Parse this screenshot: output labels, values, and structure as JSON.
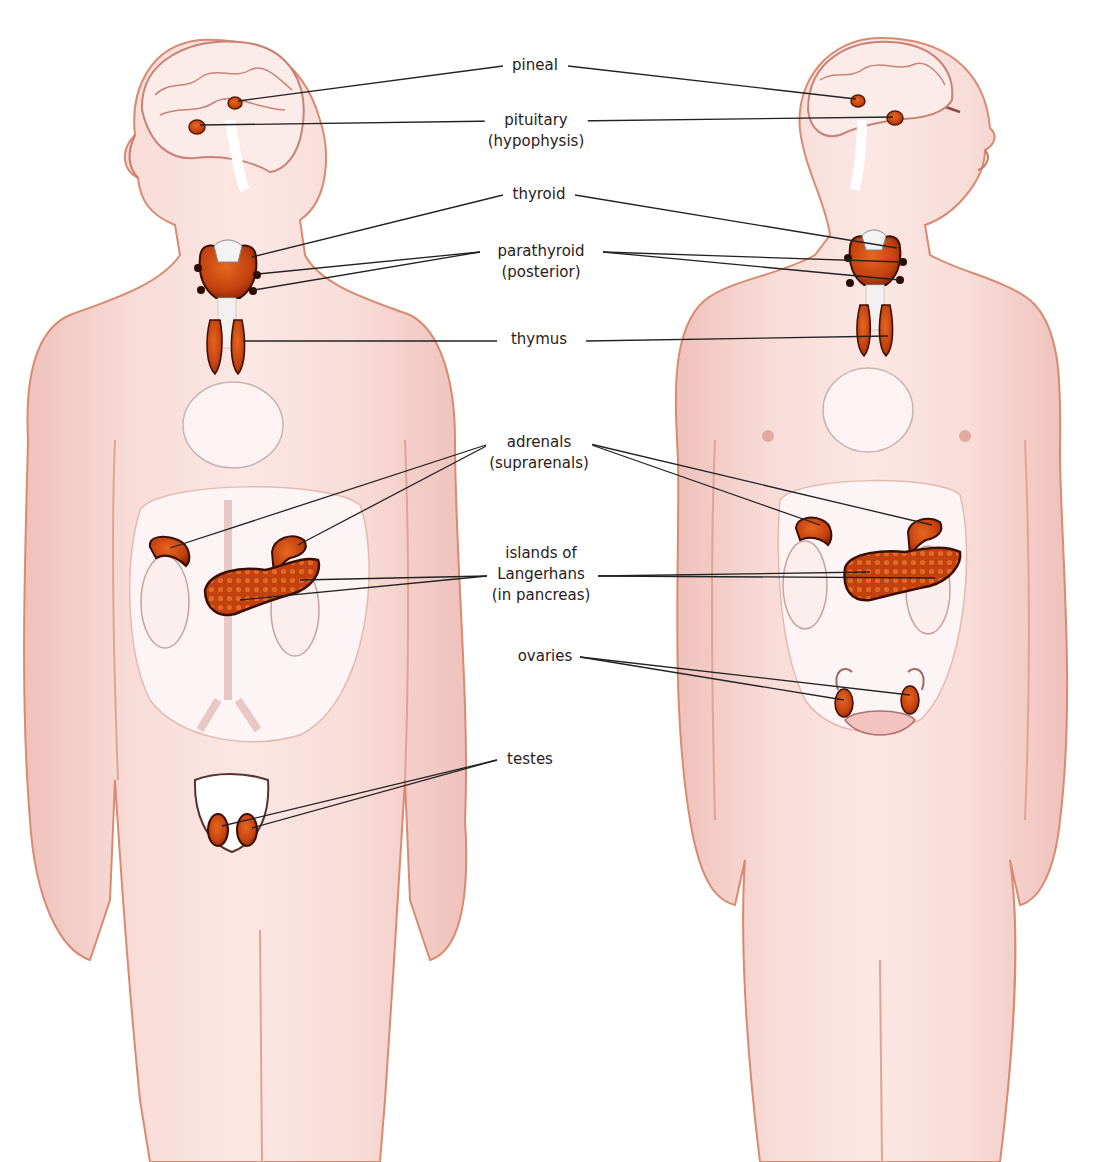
{
  "diagram": {
    "colors": {
      "skin": "#f6d7d3",
      "skin_shade": "#eab3ac",
      "skin_outline": "#d98a6f",
      "gland": "#c2410f",
      "gland_dark": "#7a1e05",
      "organ_pale": "#f8ecec",
      "leader_line": "#222222",
      "text": "#2a2020"
    },
    "figures": [
      {
        "id": "male",
        "facing": "left",
        "glands": [
          "pineal",
          "pituitary",
          "thyroid",
          "parathyroid",
          "thymus",
          "adrenals",
          "pancreas",
          "testes"
        ]
      },
      {
        "id": "female",
        "facing": "right",
        "glands": [
          "pineal",
          "pituitary",
          "thyroid",
          "parathyroid",
          "thymus",
          "adrenals",
          "pancreas",
          "ovaries"
        ]
      }
    ],
    "labels": [
      {
        "id": "pineal",
        "lines": [
          "pineal"
        ]
      },
      {
        "id": "pituitary",
        "lines": [
          "pituitary",
          "(hypophysis)"
        ]
      },
      {
        "id": "thyroid",
        "lines": [
          "thyroid"
        ]
      },
      {
        "id": "parathyroid",
        "lines": [
          "parathyroid",
          "(posterior)"
        ]
      },
      {
        "id": "thymus",
        "lines": [
          "thymus"
        ]
      },
      {
        "id": "adrenals",
        "lines": [
          "adrenals",
          "(suprarenals)"
        ]
      },
      {
        "id": "islands",
        "lines": [
          "islands of",
          "Langerhans",
          "(in pancreas)"
        ]
      },
      {
        "id": "ovaries",
        "lines": [
          "ovaries"
        ]
      },
      {
        "id": "testes",
        "lines": [
          "testes"
        ]
      }
    ]
  }
}
